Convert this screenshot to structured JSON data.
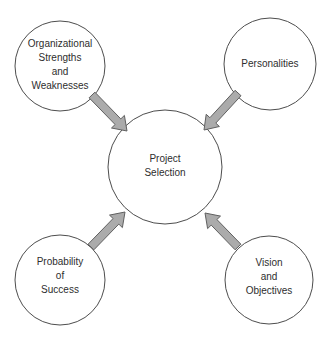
{
  "diagram": {
    "type": "hub-and-spoke",
    "center_node": {
      "label": "Project Selection",
      "lines": [
        "Project",
        "Selection"
      ]
    },
    "nodes": [
      {
        "label": "Organizational Strengths and Weaknesses",
        "lines": [
          "Organizational",
          "Strengths",
          "and",
          "Weaknesses"
        ],
        "position": "top-left"
      },
      {
        "label": "Personalities",
        "lines": [
          "Personalities"
        ],
        "position": "top-right"
      },
      {
        "label": "Probability of Success",
        "lines": [
          "Probability",
          "of",
          "Success"
        ],
        "position": "bottom-left"
      },
      {
        "label": "Vision and Objectives",
        "lines": [
          "Vision",
          "and",
          "Objectives"
        ],
        "position": "bottom-right"
      }
    ],
    "arrows": [
      {
        "from": "Organizational Strengths and Weaknesses",
        "to": "Project Selection"
      },
      {
        "from": "Personalities",
        "to": "Project Selection"
      },
      {
        "from": "Probability of Success",
        "to": "Project Selection"
      },
      {
        "from": "Vision and Objectives",
        "to": "Project Selection"
      }
    ],
    "colors": {
      "background": "#ffffff",
      "node_fill": "#ffffff",
      "node_stroke": "#4d4d4d",
      "arrow_fill": "#ababab",
      "arrow_stroke": "#606060",
      "text": "#2e2e2e"
    }
  }
}
